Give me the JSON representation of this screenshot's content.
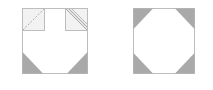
{
  "diagram": {
    "colors": {
      "outline": "#bdbdbd",
      "corner_fill": "#a9a9a9",
      "light_fill": "#f2f2f2",
      "hatch": "#b5b5b5",
      "background": "#ffffff"
    },
    "left_figure": {
      "outer_square": {
        "x": 22,
        "y": 8,
        "size": 66
      },
      "top_left_square": {
        "x": 22,
        "y": 8,
        "size": 22,
        "diagonal": "dashed"
      },
      "top_right_square": {
        "x": 66,
        "y": 8,
        "size": 22,
        "diagonal": "double-hatched"
      },
      "bottom_corner_triangles": 2,
      "corner_leg": 20
    },
    "right_figure": {
      "outer_square": {
        "x": 133,
        "y": 8,
        "size": 62
      },
      "corner_triangles": 4,
      "corner_leg": 20
    }
  }
}
